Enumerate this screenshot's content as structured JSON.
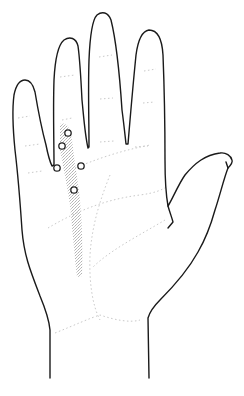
{
  "illustration": {
    "subject": "open palm of right hand",
    "outline_color": "#1a1a1a",
    "crease_color": "#c8c8c8",
    "shading_color": "#b8b8b8",
    "marker_stroke": "#222222",
    "markers": [
      {
        "id": "point-1",
        "cx": 68,
        "cy": 133
      },
      {
        "id": "point-2",
        "cx": 62,
        "cy": 146
      },
      {
        "id": "point-3",
        "cx": 57,
        "cy": 168
      },
      {
        "id": "point-4",
        "cx": 81,
        "cy": 166
      },
      {
        "id": "point-5",
        "cx": 74,
        "cy": 190
      }
    ]
  }
}
